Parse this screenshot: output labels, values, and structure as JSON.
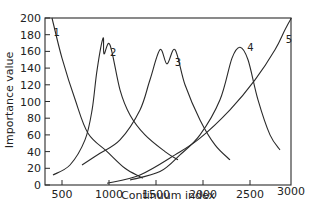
{
  "chart_data": {
    "type": "line",
    "title": "",
    "xlabel": "Continuum index",
    "ylabel": "Importance value",
    "xlim": [
      320,
      3000
    ],
    "ylim": [
      0,
      200
    ],
    "xticks": [
      500,
      1000,
      1500,
      2000,
      2500,
      3000
    ],
    "yticks": [
      0,
      20,
      40,
      60,
      80,
      100,
      120,
      140,
      160,
      180,
      200
    ],
    "grid": false,
    "legend": "none (curves labelled inline 1-5)",
    "series": [
      {
        "name": "1",
        "label_pos": [
          410,
          178
        ],
        "x": [
          394,
          500,
          640,
          777,
          980,
          1170,
          1330,
          1360
        ],
        "y": [
          200,
          152,
          102,
          62,
          40,
          20,
          10,
          8
        ]
      },
      {
        "name": "2",
        "label_pos": [
          1010,
          155
        ],
        "x": [
          404,
          585,
          745,
          820,
          873,
          937,
          947,
          1010,
          1117,
          1223,
          1383,
          1596,
          1734
        ],
        "y": [
          12,
          24,
          54,
          90,
          138,
          176,
          157,
          168,
          114,
          84,
          60,
          40,
          30
        ]
      },
      {
        "name": "3",
        "label_pos": [
          1700,
          143
        ],
        "x": [
          713,
          904,
          1117,
          1330,
          1436,
          1543,
          1617,
          1702,
          1809,
          1968,
          2128,
          2287
        ],
        "y": [
          24,
          38,
          54,
          90,
          126,
          162,
          145,
          162,
          120,
          78,
          48,
          30
        ]
      },
      {
        "name": "4",
        "label_pos": [
          2470,
          160
        ],
        "x": [
          1223,
          1543,
          1755,
          1968,
          2181,
          2309,
          2394,
          2479,
          2585,
          2713,
          2819
        ],
        "y": [
          6,
          16,
          36,
          60,
          102,
          152,
          165,
          150,
          102,
          60,
          42
        ]
      },
      {
        "name": "5",
        "label_pos": [
          2880,
          170
        ],
        "x": [
          980,
          1330,
          1702,
          1968,
          2287,
          2553,
          2766,
          2872,
          2940
        ],
        "y": [
          2,
          12,
          36,
          56,
          90,
          126,
          162,
          186,
          200
        ]
      }
    ]
  },
  "axes": {
    "x_label": "Continuum index",
    "y_label": "Importance value",
    "x_tick_labels": [
      "500",
      "1000",
      "1500",
      "2000",
      "2500",
      "3000"
    ],
    "y_tick_labels": [
      "0",
      "20",
      "40",
      "60",
      "80",
      "100",
      "120",
      "140",
      "160",
      "180",
      "200"
    ]
  },
  "curve_labels": [
    "1",
    "2",
    "3",
    "4",
    "5"
  ]
}
